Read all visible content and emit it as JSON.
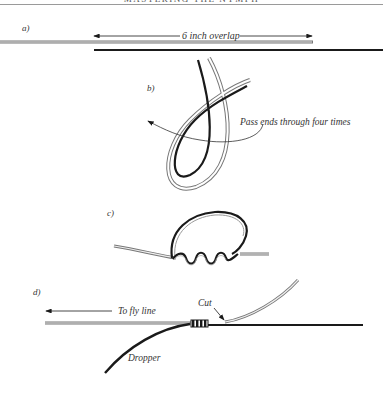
{
  "header": {
    "running_title": "MASTERING THE NYMPH"
  },
  "panels": [
    {
      "id": "a",
      "label": "a)",
      "annotations": [
        "6 inch overlap"
      ]
    },
    {
      "id": "b",
      "label": "b)",
      "annotations": [
        "Pass ends through four times"
      ]
    },
    {
      "id": "c",
      "label": "c)",
      "annotations": []
    },
    {
      "id": "d",
      "label": "d)",
      "annotations": [
        "To fly line",
        "Cut",
        "Dropper"
      ]
    }
  ],
  "labels": {
    "a": "a)",
    "overlap": "6 inch overlap",
    "b": "b)",
    "pass_ends": "Pass ends through four times",
    "c": "c)",
    "d": "d)",
    "to_fly_line": "To fly line",
    "cut": "Cut",
    "dropper": "Dropper"
  },
  "colors": {
    "line_dark": "#1a1a1a",
    "line_light_outline": "#777777",
    "line_light_fill": "#ffffff",
    "text": "#333333"
  }
}
